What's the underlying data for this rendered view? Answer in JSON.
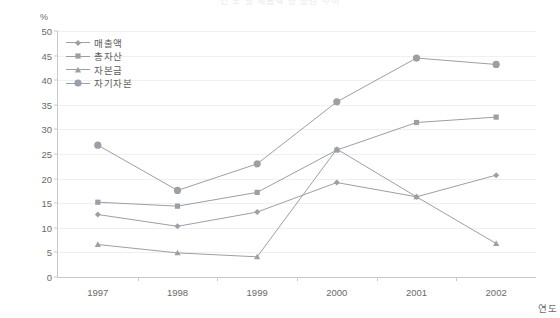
{
  "title": "연 도 별   매출액 등 증감 추이",
  "y_axis_unit": "%",
  "x_axis_label": "연도",
  "chart_data": {
    "type": "line",
    "title": "연 도 별   매출액 등 증감 추이",
    "xlabel": "연도",
    "ylabel": "%",
    "ylim": [
      0,
      50
    ],
    "ytick_step": 5,
    "yticks": [
      "0",
      "5",
      "10",
      "15",
      "20",
      "25",
      "30",
      "35",
      "40",
      "45",
      "50"
    ],
    "grid": true,
    "legend_position": "top-left-inside",
    "categories": [
      "1997",
      "1998",
      "1999",
      "2000",
      "2001",
      "2002"
    ],
    "series": [
      {
        "name": "매출액",
        "marker": "diamond",
        "color": "#9aa0a6",
        "values": [
          12.7,
          10.3,
          13.2,
          19.2,
          16.3,
          20.7
        ]
      },
      {
        "name": "총자산",
        "marker": "square",
        "color": "#9aa0a6",
        "values": [
          15.2,
          14.4,
          17.2,
          25.8,
          31.4,
          32.5
        ]
      },
      {
        "name": "자본금",
        "marker": "triangle",
        "color": "#9aa0a6",
        "values": [
          6.6,
          4.9,
          4.1,
          26.0,
          16.3,
          6.8
        ]
      },
      {
        "name": "자기자본",
        "marker": "circle",
        "color": "#9aa0a6",
        "values": [
          26.8,
          17.6,
          23.0,
          35.6,
          44.5,
          43.2
        ]
      }
    ]
  },
  "colors": {
    "line": "#9aa0a6",
    "grid": "#f0f0f2",
    "axis": "#c9c9c9",
    "text": "#6a6a6a"
  }
}
